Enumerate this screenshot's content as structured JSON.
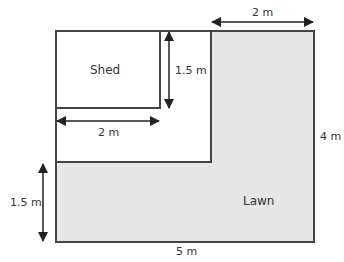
{
  "diagram": {
    "shed_label": "Shed",
    "lawn_label": "Lawn",
    "dimensions": {
      "top_width": "2 m",
      "shed_height": "1.5 m",
      "shed_width": "2 m",
      "right_height": "4 m",
      "left_height": "1.5 m",
      "bottom_width": "5 m"
    },
    "colors": {
      "lawn_fill": "#e6e6e6",
      "line": "#444444",
      "arrow": "#222222"
    }
  }
}
